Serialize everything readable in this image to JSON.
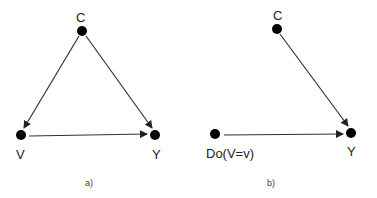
{
  "diagrams": [
    {
      "id": "a",
      "caption": "a)",
      "nodes": [
        {
          "label": "C",
          "x": 82,
          "y": 31
        },
        {
          "label": "V",
          "x": 21,
          "y": 135
        },
        {
          "label": "Y",
          "x": 155,
          "y": 135
        }
      ],
      "edges": [
        {
          "from": "C",
          "to": "V"
        },
        {
          "from": "C",
          "to": "Y"
        },
        {
          "from": "V",
          "to": "Y"
        }
      ]
    },
    {
      "id": "b",
      "caption": "b)",
      "nodes": [
        {
          "label": "C",
          "x": 277,
          "y": 29
        },
        {
          "label": "Do(V=v)",
          "x": 215,
          "y": 134
        },
        {
          "label": "Y",
          "x": 351,
          "y": 133
        }
      ],
      "edges": [
        {
          "from": "C",
          "to": "Y"
        },
        {
          "from": "Do(V=v)",
          "to": "Y"
        }
      ]
    }
  ],
  "colors": {
    "node": "#000000",
    "edge": "#222222",
    "text": "#222222"
  }
}
